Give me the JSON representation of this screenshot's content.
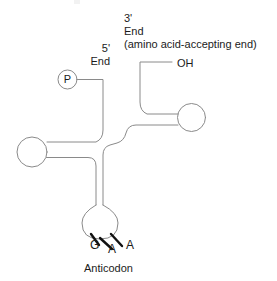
{
  "figure": {
    "background_color": "#ffffff",
    "line_color": "#8a8a8a",
    "tick_color": "#111111",
    "text_color": "#1b1b1b",
    "width": 277,
    "height": 281
  },
  "labels": {
    "five_prime_symbol": "5'",
    "five_prime_end": "End",
    "three_prime_symbol": "3'",
    "three_prime_end": "End",
    "three_prime_note": "(amino acid-accepting end)",
    "hydroxyl": "OH",
    "phosphate": "P",
    "anticodon_caption": "Anticodon"
  },
  "anticodon": {
    "bases": [
      {
        "letter": "G"
      },
      {
        "letter": "A"
      },
      {
        "letter": "A"
      }
    ]
  }
}
